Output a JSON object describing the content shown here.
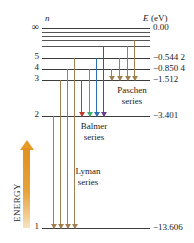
{
  "figure": {
    "header_n": "n",
    "header_E": "E",
    "header_E_unit": "(eV)",
    "energy_axis_label": "ENERGY"
  },
  "levels": [
    {
      "n": "∞",
      "energy": "0.00",
      "n_label": "∞",
      "e_label": "0.00",
      "y": 28,
      "x1": 42,
      "x2": 150
    },
    {
      "n": "",
      "energy": "",
      "n_label": "",
      "e_label": "",
      "y": 32,
      "x1": 42,
      "x2": 150
    },
    {
      "n": "",
      "energy": "",
      "n_label": "",
      "e_label": "",
      "y": 36,
      "x1": 42,
      "x2": 150
    },
    {
      "n": "",
      "energy": "",
      "n_label": "",
      "e_label": "",
      "y": 40,
      "x1": 42,
      "x2": 150
    },
    {
      "n": "",
      "energy": "",
      "n_label": "",
      "e_label": "",
      "y": 46,
      "x1": 42,
      "x2": 150
    },
    {
      "n": "5",
      "energy": "-0.544 2",
      "n_label": "5",
      "e_label": "−0.544 2",
      "y": 58,
      "x1": 42,
      "x2": 150
    },
    {
      "n": "4",
      "energy": "-0.850 4",
      "n_label": "4",
      "e_label": "−0.850 4",
      "y": 69,
      "x1": 42,
      "x2": 150
    },
    {
      "n": "3",
      "energy": "-1.512",
      "n_label": "3",
      "e_label": "−1.512",
      "y": 80,
      "x1": 42,
      "x2": 150
    },
    {
      "n": "2",
      "energy": "-3.401",
      "n_label": "2",
      "e_label": "−3.401",
      "y": 116,
      "x1": 42,
      "x2": 150
    },
    {
      "n": "1",
      "energy": "-13.606",
      "n_label": "1",
      "e_label": "−13.606",
      "y": 228,
      "x1": 42,
      "x2": 150
    }
  ],
  "series": [
    {
      "name": "paschen",
      "label_line1": "Paschen",
      "label_line2": "series"
    },
    {
      "name": "balmer",
      "label_line1": "Balmer",
      "label_line2": "series"
    },
    {
      "name": "lyman",
      "label_line1": "Lyman",
      "label_line2": "series"
    }
  ],
  "transitions": {
    "lyman": [
      {
        "x": 53,
        "from_y": 116,
        "to_y": 228,
        "color": "#a08050"
      },
      {
        "x": 60,
        "from_y": 80,
        "to_y": 228,
        "color": "#a08050"
      },
      {
        "x": 67,
        "from_y": 69,
        "to_y": 228,
        "color": "#a08050"
      },
      {
        "x": 74,
        "from_y": 58,
        "to_y": 228,
        "color": "#a08050"
      }
    ],
    "balmer": [
      {
        "x": 81,
        "from_y": 80,
        "to_y": 116,
        "color": "#c0392b"
      },
      {
        "x": 89,
        "from_y": 69,
        "to_y": 116,
        "color": "#3fae6e"
      },
      {
        "x": 96,
        "from_y": 58,
        "to_y": 116,
        "color": "#2f6fb5"
      },
      {
        "x": 103,
        "from_y": 46,
        "to_y": 116,
        "color": "#6a3d8f"
      }
    ],
    "paschen": [
      {
        "x": 111,
        "from_y": 69,
        "to_y": 80,
        "color": "#a08050"
      },
      {
        "x": 119,
        "from_y": 58,
        "to_y": 80,
        "color": "#a08050"
      },
      {
        "x": 127,
        "from_y": 46,
        "to_y": 80,
        "color": "#a08050"
      },
      {
        "x": 134,
        "from_y": 40,
        "to_y": 80,
        "color": "#a08050"
      }
    ]
  },
  "colors": {
    "level_line": "#3c3c3c",
    "energy_arrow": "#e79a28",
    "balmer_red": "#c0392b",
    "balmer_green": "#3fae6e",
    "balmer_blue": "#2f6fb5",
    "balmer_violet": "#6a3d8f",
    "lyman_brown": "#a08050",
    "paschen_brown": "#a08050"
  },
  "chart_data": {
    "type": "line",
    "xlabel": "",
    "ylabel": "E (eV)",
    "categories": [
      "1",
      "2",
      "3",
      "4",
      "5",
      "∞"
    ],
    "values": [
      -13.606,
      -3.401,
      -1.512,
      -0.8504,
      -0.5442,
      0.0
    ],
    "ylim": [
      -13.606,
      0.0
    ],
    "grid": false,
    "legend": [
      "Lyman series",
      "Balmer series",
      "Paschen series"
    ],
    "annotations": [
      "n = ∞ at 0.00 eV",
      "n = 5 at −0.544 2 eV",
      "n = 4 at −0.850 4 eV",
      "n = 3 at −1.512 eV",
      "n = 2 at −3.401 eV",
      "n = 1 at −13.606 eV"
    ]
  }
}
